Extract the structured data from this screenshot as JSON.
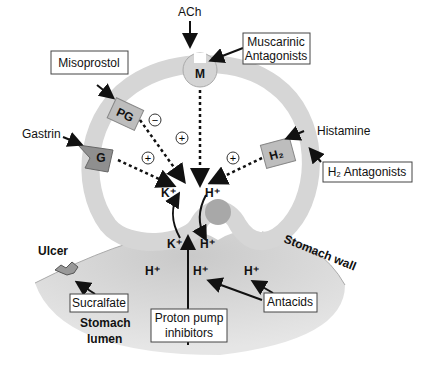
{
  "diagram": {
    "top_agonist": "ACh",
    "muscarinic_box": [
      "Muscarinic",
      "Antagonists"
    ],
    "misoprostol_box": "Misoprostol",
    "gastrin": "Gastrin",
    "histamine": "Histamine",
    "h2_box": "H₂ Antagonists",
    "receptors": {
      "m": "M",
      "pg": "PG",
      "g": "G",
      "h2": "H₂"
    },
    "signs": {
      "pg": "−",
      "m": "+",
      "g": "+",
      "h2": "+"
    },
    "ions": {
      "k_top": "K⁺",
      "h_top": "H⁺",
      "k_bottom": "K⁺",
      "h_bottom": "H⁺",
      "h_lumen": "H⁺"
    },
    "ulcer": "Ulcer",
    "stomach_wall": "Stomach wall",
    "sucralfate_box": "Sucralfate",
    "lumen": [
      "Stomach",
      "lumen"
    ],
    "ppi_box": [
      "Proton pump",
      "inhibitors"
    ],
    "antacids_box": "Antacids"
  },
  "colors": {
    "cell": "#d9d9d9",
    "lumen": "#c8c8c8",
    "receptor": "#bdbdbd",
    "dark_receptor": "#8f8f8f"
  }
}
